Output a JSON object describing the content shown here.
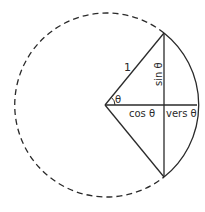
{
  "diagram": {
    "colors": {
      "stroke": "#2a2a2a",
      "background": "#ffffff"
    },
    "geometry": {
      "center": [
        105,
        105
      ],
      "radius": 92,
      "top_vertex": [
        164,
        33
      ],
      "bottom_vertex": [
        164,
        177
      ],
      "chord_foot": [
        164,
        105
      ],
      "arc_end": [
        197,
        105
      ]
    },
    "labels": {
      "radius": "1",
      "angle": "θ",
      "sine": "sin θ",
      "cosine": "cos θ",
      "versine": "vers θ"
    }
  }
}
